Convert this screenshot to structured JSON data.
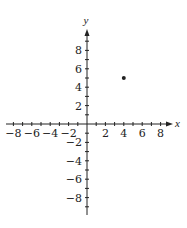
{
  "chart_data": {
    "type": "scatter",
    "title": "",
    "xlabel": "x",
    "ylabel": "y",
    "xlim": [
      -9,
      9
    ],
    "ylim": [
      -10,
      10
    ],
    "grid": false,
    "legend": null,
    "x_ticks": [
      -8,
      -6,
      -4,
      -2,
      2,
      4,
      6,
      8
    ],
    "y_ticks": [
      -8,
      -6,
      -4,
      -2,
      2,
      4,
      6,
      8
    ],
    "x_tick_labels": [
      "−8",
      "−6",
      "−4",
      "−2",
      "2",
      "4",
      "6",
      "8"
    ],
    "y_tick_labels": [
      "−8",
      "−6",
      "−4",
      "−2",
      "2",
      "4",
      "6",
      "8"
    ],
    "minor_tick_step": 1,
    "points": [
      {
        "x": 4,
        "y": 5
      }
    ]
  },
  "colors": {
    "ink": "#222222",
    "background": "#ffffff"
  }
}
